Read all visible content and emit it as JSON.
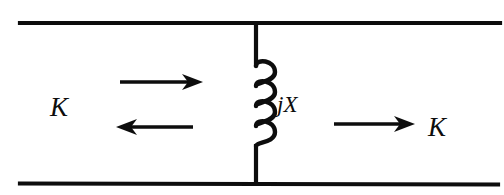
{
  "diagram": {
    "type": "electrical-circuit-schematic",
    "background_color": "#ffffff",
    "ink_color": "#0d0d0d",
    "labels": {
      "left_current": "K",
      "right_current": "K",
      "reactance": "jX"
    },
    "components": [
      {
        "name": "top-conductor",
        "kind": "wire",
        "orientation": "horizontal",
        "x1": 20,
        "y1": 23,
        "x2": 500,
        "y2": 23
      },
      {
        "name": "bottom-conductor",
        "kind": "wire",
        "orientation": "horizontal",
        "x1": 20,
        "y1": 183,
        "x2": 498,
        "y2": 183
      },
      {
        "name": "shunt-branch-upper-stem",
        "kind": "wire",
        "orientation": "vertical",
        "x1": 256,
        "y1": 23,
        "x2": 256,
        "y2": 66
      },
      {
        "name": "shunt-branch-lower-stem",
        "kind": "wire",
        "orientation": "vertical",
        "x1": 256,
        "y1": 145,
        "x2": 256,
        "y2": 183
      },
      {
        "name": "inductor-coil",
        "kind": "inductor",
        "loops": 4,
        "loop_side": "right",
        "x": 256,
        "y_top": 66,
        "y_bottom": 145,
        "bulge_width": 16
      }
    ],
    "arrows": [
      {
        "name": "incident-wave-arrow",
        "direction": "right",
        "x_tail": 120,
        "x_head": 202,
        "y": 82
      },
      {
        "name": "reflected-wave-arrow",
        "direction": "left",
        "x_tail": 193,
        "x_head": 117,
        "y": 127
      },
      {
        "name": "transmitted-wave-arrow",
        "direction": "right",
        "x_tail": 334,
        "x_head": 414,
        "y": 124
      }
    ],
    "label_positions": {
      "left_current": {
        "x": 50,
        "y": 116
      },
      "reactance": {
        "x": 277,
        "y": 112
      },
      "right_current": {
        "x": 428,
        "y": 136
      }
    }
  }
}
